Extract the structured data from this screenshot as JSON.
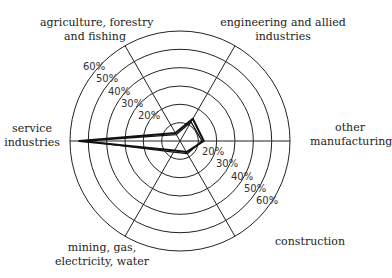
{
  "chart_data": {
    "type": "radar",
    "title": "",
    "axes": [
      "service industries",
      "agriculture, forestry and fishing",
      "engineering and allied industries",
      "other manufacturing",
      "construction",
      "mining, gas, electricity, water"
    ],
    "axis_labels_lines": [
      [
        "service",
        "industries"
      ],
      [
        "agriculture, forestry",
        "and fishing"
      ],
      [
        "engineering and allied",
        "industries"
      ],
      [
        "other",
        "manufacturing"
      ],
      [
        "construction"
      ],
      [
        "mining, gas,",
        "electricity, water"
      ]
    ],
    "ring_ticks": [
      "20%",
      "30%",
      "40%",
      "50%",
      "60%"
    ],
    "rings": [
      10,
      20,
      30,
      40,
      50,
      60
    ],
    "rlim": [
      0,
      60
    ],
    "series": [
      {
        "name": "series 1",
        "values": [
          55,
          5,
          14,
          13,
          7,
          6
        ]
      },
      {
        "name": "series 2",
        "values": [
          52,
          4,
          12,
          12,
          8,
          7
        ]
      }
    ],
    "grid": true,
    "legend": "none"
  }
}
